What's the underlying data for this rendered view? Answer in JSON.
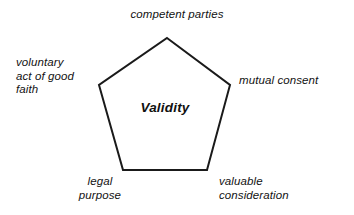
{
  "diagram": {
    "title": "Validity",
    "center_label": "Validity",
    "shape": "pentagon",
    "stroke_color": "#1a1a1a",
    "fill_color": "#ffffff",
    "background_color": "#ffffff",
    "stroke_width": 2,
    "vertices": [
      {
        "name": "apex",
        "x": 167,
        "y": 38
      },
      {
        "name": "right",
        "x": 230,
        "y": 85
      },
      {
        "name": "bottom-right",
        "x": 207,
        "y": 170
      },
      {
        "name": "bottom-left",
        "x": 123,
        "y": 170
      },
      {
        "name": "left",
        "x": 99,
        "y": 85
      }
    ],
    "labels": [
      {
        "id": "competent-parties",
        "text": "competent parties",
        "position": "top"
      },
      {
        "id": "mutual-consent",
        "text": "mutual consent",
        "position": "right"
      },
      {
        "id": "valuable-consideration",
        "text": "valuable\nconsideration",
        "position": "bottom-right"
      },
      {
        "id": "legal-purpose",
        "text": "legal\npurpose",
        "position": "bottom-left"
      },
      {
        "id": "voluntary-act-of-good-faith",
        "text": "voluntary\nact of good\nfaith",
        "position": "left"
      }
    ]
  }
}
